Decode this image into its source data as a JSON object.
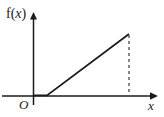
{
  "figure": {
    "type": "math-plot-diagram",
    "background_color": "#ffffff",
    "ink_color": "#1a1a1a",
    "labels": {
      "y_axis": "f(x)",
      "y_axis_prefix": "f(",
      "y_axis_variable": "x",
      "y_axis_suffix": ")",
      "origin": "O",
      "x_axis": "x"
    },
    "axes": {
      "x_axis": {
        "start_x": 2,
        "end_x": 152,
        "y": 96,
        "arrow_tip_x": 158,
        "has_arrow": true
      },
      "y_axis": {
        "x": 33,
        "start_y": 105,
        "end_y": 19,
        "arrow_tip_y": 12,
        "has_arrow": true
      }
    },
    "curve": {
      "description": "piecewise-linear graph: constant zero then increasing ray",
      "flat_segment": {
        "x1": 33,
        "y1": 96,
        "x2": 47,
        "y2": 96
      },
      "rising_segment": {
        "x1": 47,
        "y1": 96,
        "x2": 129,
        "y2": 34
      },
      "stroke_width": 1.6
    },
    "dashed_drop_line": {
      "x": 129,
      "y_top": 35,
      "y_bottom": 95,
      "dash_pattern": "3,3",
      "stroke_width": 1.4
    }
  }
}
